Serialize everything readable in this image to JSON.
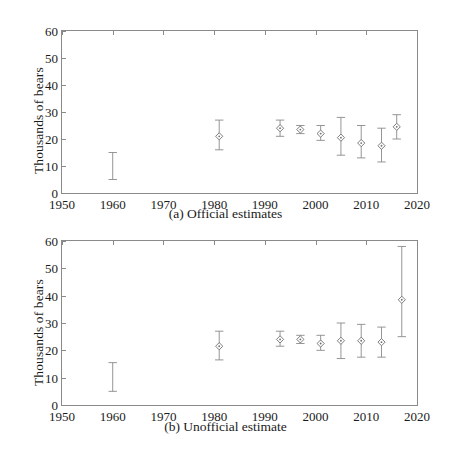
{
  "figure": {
    "ylabel": "Thousands of bears",
    "yticks": [
      0,
      10,
      20,
      30,
      40,
      50,
      60
    ],
    "xticks": [
      1950,
      1960,
      1970,
      1980,
      1990,
      2000,
      2010,
      2020
    ],
    "xlim": [
      1950,
      2020
    ],
    "ylim": [
      0,
      60
    ],
    "line_color": "#8a8a8a",
    "marker_color": "#6e6e6e",
    "text_color": "#1a1a1a"
  },
  "panels": [
    {
      "id": "a",
      "caption": "(a) Official estimates",
      "chart_data": {
        "type": "scatter",
        "title": "(a) Official estimates",
        "xlabel": "",
        "ylabel": "Thousands of bears",
        "xlim": [
          1950,
          2020
        ],
        "ylim": [
          0,
          60
        ],
        "xticks": [
          1950,
          1960,
          1970,
          1980,
          1990,
          2000,
          2010,
          2020
        ],
        "yticks": [
          0,
          10,
          20,
          30,
          40,
          50,
          60
        ],
        "grid": false,
        "legend": "none",
        "error_bars": true,
        "marker": "diamond-with-dot",
        "points": [
          {
            "x": 1960,
            "y": null,
            "ylow": 5.0,
            "yhigh": 15.0,
            "marker": false
          },
          {
            "x": 1981,
            "y": 21.0,
            "ylow": 16.0,
            "yhigh": 27.0,
            "marker": true
          },
          {
            "x": 1993,
            "y": 24.0,
            "ylow": 21.0,
            "yhigh": 27.0,
            "marker": true
          },
          {
            "x": 1997,
            "y": 23.5,
            "ylow": 22.0,
            "yhigh": 25.0,
            "marker": true
          },
          {
            "x": 2001,
            "y": 22.0,
            "ylow": 19.5,
            "yhigh": 25.0,
            "marker": true
          },
          {
            "x": 2005,
            "y": 20.5,
            "ylow": 14.0,
            "yhigh": 28.0,
            "marker": true
          },
          {
            "x": 2009,
            "y": 18.5,
            "ylow": 13.0,
            "yhigh": 25.0,
            "marker": true
          },
          {
            "x": 2013,
            "y": 17.5,
            "ylow": 11.5,
            "yhigh": 24.0,
            "marker": true
          },
          {
            "x": 2016,
            "y": 24.5,
            "ylow": 20.0,
            "yhigh": 29.0,
            "marker": true
          }
        ]
      }
    },
    {
      "id": "b",
      "caption": "(b) Unofficial estimate",
      "chart_data": {
        "type": "scatter",
        "title": "(b) Unofficial estimate",
        "xlabel": "",
        "ylabel": "Thousands of bears",
        "xlim": [
          1950,
          2020
        ],
        "ylim": [
          0,
          60
        ],
        "xticks": [
          1950,
          1960,
          1970,
          1980,
          1990,
          2000,
          2010,
          2020
        ],
        "yticks": [
          0,
          10,
          20,
          30,
          40,
          50,
          60
        ],
        "grid": false,
        "legend": "none",
        "error_bars": true,
        "marker": "diamond-with-dot",
        "points": [
          {
            "x": 1960,
            "y": null,
            "ylow": 5.0,
            "yhigh": 15.5,
            "marker": false
          },
          {
            "x": 1981,
            "y": 21.5,
            "ylow": 16.5,
            "yhigh": 27.0,
            "marker": true
          },
          {
            "x": 1993,
            "y": 24.0,
            "ylow": 21.5,
            "yhigh": 27.0,
            "marker": true
          },
          {
            "x": 1997,
            "y": 24.0,
            "ylow": 22.5,
            "yhigh": 25.5,
            "marker": true
          },
          {
            "x": 2001,
            "y": 22.5,
            "ylow": 20.0,
            "yhigh": 25.5,
            "marker": true
          },
          {
            "x": 2005,
            "y": 23.5,
            "ylow": 17.0,
            "yhigh": 30.0,
            "marker": true
          },
          {
            "x": 2009,
            "y": 23.5,
            "ylow": 17.5,
            "yhigh": 29.5,
            "marker": true
          },
          {
            "x": 2013,
            "y": 23.0,
            "ylow": 17.5,
            "yhigh": 28.5,
            "marker": true
          },
          {
            "x": 2017,
            "y": 38.5,
            "ylow": 25.0,
            "yhigh": 58.0,
            "marker": true
          }
        ]
      }
    }
  ]
}
